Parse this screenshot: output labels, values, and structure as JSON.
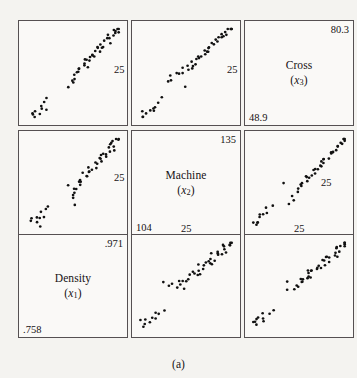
{
  "figure": {
    "caption": "(a)",
    "type": "scatterplot-matrix",
    "variables": [
      {
        "key": "x1",
        "name": "Density",
        "symbol": "x",
        "subscript": "1",
        "min": ".758",
        "max": ".971"
      },
      {
        "key": "x2",
        "name": "Machine",
        "symbol": "x",
        "subscript": "2",
        "min": "104",
        "max": "135"
      },
      {
        "key": "x3",
        "name": "Cross",
        "symbol": "x",
        "subscript": "3",
        "min": "48.9",
        "max": "80.3"
      }
    ],
    "shared_ticks": [
      {
        "label": "25",
        "panel": "row1-col1-right"
      },
      {
        "label": "25",
        "panel": "row1-col2-right"
      },
      {
        "label": "25",
        "panel": "row2-col1-right"
      },
      {
        "label": "25",
        "panel": "row2-col3-inner"
      },
      {
        "label": "25",
        "panel": "row3-col2-top"
      },
      {
        "label": "25",
        "panel": "row3-col3-top"
      }
    ]
  },
  "chart_data": {
    "type": "scatter",
    "title": "",
    "subtitle": "",
    "caption": "(a)",
    "layout": "3x3 scatterplot matrix, diagonal panels carry variable names and axis ranges",
    "grid": false,
    "legend": "none",
    "variables": [
      "Density (x1)",
      "Machine (x2)",
      "Cross (x3)"
    ],
    "axis_ranges": {
      "Density": [
        0.758,
        0.971
      ],
      "Machine": [
        104,
        135
      ],
      "Cross": [
        48.9,
        80.3
      ]
    },
    "tick_label_count": "25",
    "n_points": 48,
    "points": [
      {
        "x1": 0.773,
        "x2": 106.5,
        "x3": 50.3
      },
      {
        "x1": 0.776,
        "x2": 107.0,
        "x3": 51.2
      },
      {
        "x1": 0.781,
        "x2": 106.0,
        "x3": 49.8
      },
      {
        "x1": 0.784,
        "x2": 108.5,
        "x3": 52.6
      },
      {
        "x1": 0.788,
        "x2": 105.5,
        "x3": 51.6
      },
      {
        "x1": 0.792,
        "x2": 109.5,
        "x3": 53.4
      },
      {
        "x1": 0.796,
        "x2": 108.0,
        "x3": 52.0
      },
      {
        "x1": 0.801,
        "x2": 110.5,
        "x3": 54.8
      },
      {
        "x1": 0.806,
        "x2": 109.0,
        "x3": 53.0
      },
      {
        "x1": 0.812,
        "x2": 112.0,
        "x3": 56.0
      },
      {
        "x1": 0.862,
        "x2": 114.0,
        "x3": 62.5
      },
      {
        "x1": 0.866,
        "x2": 116.0,
        "x3": 64.0
      },
      {
        "x1": 0.869,
        "x2": 115.0,
        "x3": 63.2
      },
      {
        "x1": 0.872,
        "x2": 118.0,
        "x3": 65.5
      },
      {
        "x1": 0.875,
        "x2": 117.0,
        "x3": 64.6
      },
      {
        "x1": 0.878,
        "x2": 119.5,
        "x3": 66.0
      },
      {
        "x1": 0.881,
        "x2": 118.5,
        "x3": 65.2
      },
      {
        "x1": 0.884,
        "x2": 121.0,
        "x3": 67.4
      },
      {
        "x1": 0.887,
        "x2": 120.0,
        "x3": 66.6
      },
      {
        "x1": 0.89,
        "x2": 122.5,
        "x3": 68.2
      },
      {
        "x1": 0.893,
        "x2": 121.5,
        "x3": 67.0
      },
      {
        "x1": 0.896,
        "x2": 123.5,
        "x3": 69.0
      },
      {
        "x1": 0.899,
        "x2": 122.0,
        "x3": 68.0
      },
      {
        "x1": 0.902,
        "x2": 124.5,
        "x3": 70.2
      },
      {
        "x1": 0.905,
        "x2": 123.0,
        "x3": 69.4
      },
      {
        "x1": 0.908,
        "x2": 125.5,
        "x3": 71.0
      },
      {
        "x1": 0.911,
        "x2": 124.0,
        "x3": 70.0
      },
      {
        "x1": 0.914,
        "x2": 126.5,
        "x3": 72.4
      },
      {
        "x1": 0.917,
        "x2": 125.0,
        "x3": 71.4
      },
      {
        "x1": 0.92,
        "x2": 127.5,
        "x3": 73.0
      },
      {
        "x1": 0.923,
        "x2": 126.0,
        "x3": 72.0
      },
      {
        "x1": 0.926,
        "x2": 128.5,
        "x3": 74.2
      },
      {
        "x1": 0.929,
        "x2": 127.0,
        "x3": 73.4
      },
      {
        "x1": 0.932,
        "x2": 129.5,
        "x3": 75.0
      },
      {
        "x1": 0.935,
        "x2": 128.0,
        "x3": 74.0
      },
      {
        "x1": 0.938,
        "x2": 130.5,
        "x3": 76.2
      },
      {
        "x1": 0.941,
        "x2": 129.0,
        "x3": 75.4
      },
      {
        "x1": 0.944,
        "x2": 131.5,
        "x3": 77.0
      },
      {
        "x1": 0.947,
        "x2": 130.0,
        "x3": 76.0
      },
      {
        "x1": 0.95,
        "x2": 132.5,
        "x3": 78.0
      },
      {
        "x1": 0.953,
        "x2": 131.0,
        "x3": 77.2
      },
      {
        "x1": 0.956,
        "x2": 133.5,
        "x3": 79.0
      },
      {
        "x1": 0.959,
        "x2": 132.0,
        "x3": 78.4
      },
      {
        "x1": 0.962,
        "x2": 134.0,
        "x3": 79.6
      },
      {
        "x1": 0.965,
        "x2": 133.0,
        "x3": 78.8
      },
      {
        "x1": 0.968,
        "x2": 134.5,
        "x3": 80.0
      },
      {
        "x1": 0.87,
        "x2": 113.0,
        "x3": 61.0
      },
      {
        "x1": 0.855,
        "x2": 119.0,
        "x3": 60.0
      }
    ],
    "panels": [
      {
        "row": 1,
        "col": 1,
        "xvar": "Density",
        "yvar": "Cross",
        "kind": "scatter"
      },
      {
        "row": 1,
        "col": 2,
        "xvar": "Machine",
        "yvar": "Cross",
        "kind": "scatter"
      },
      {
        "row": 1,
        "col": 3,
        "xvar": "Cross",
        "yvar": "Cross",
        "kind": "diagonal-label"
      },
      {
        "row": 2,
        "col": 1,
        "xvar": "Density",
        "yvar": "Machine",
        "kind": "scatter"
      },
      {
        "row": 2,
        "col": 2,
        "xvar": "Machine",
        "yvar": "Machine",
        "kind": "diagonal-label"
      },
      {
        "row": 2,
        "col": 3,
        "xvar": "Cross",
        "yvar": "Machine",
        "kind": "scatter"
      },
      {
        "row": 3,
        "col": 1,
        "xvar": "Density",
        "yvar": "Density",
        "kind": "diagonal-label"
      },
      {
        "row": 3,
        "col": 2,
        "xvar": "Machine",
        "yvar": "Density",
        "kind": "scatter"
      },
      {
        "row": 3,
        "col": 3,
        "xvar": "Cross",
        "yvar": "Density",
        "kind": "scatter"
      }
    ]
  }
}
